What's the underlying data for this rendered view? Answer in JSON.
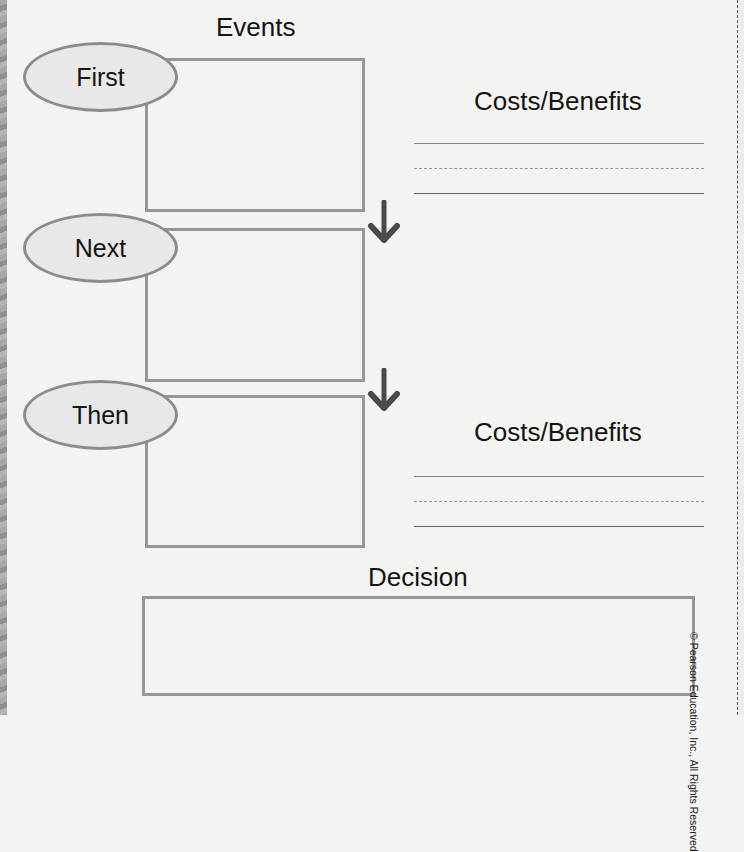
{
  "worksheet": {
    "events_heading": "Events",
    "steps": [
      {
        "label": "First"
      },
      {
        "label": "Next"
      },
      {
        "label": "Then"
      }
    ],
    "costs_benefits": [
      {
        "heading": "Costs/Benefits"
      },
      {
        "heading": "Costs/Benefits"
      }
    ],
    "decision_heading": "Decision",
    "copyright": "© Pearson Education, Inc., All Rights Reserved"
  },
  "colors": {
    "background": "#f3f3f1",
    "box_border": "#979797",
    "oval_border": "#8c8c8c",
    "oval_fill": "#e8e8e8",
    "arrow": "#4a4a4a",
    "text": "#141414"
  },
  "icons": [
    "down-arrow-icon",
    "down-arrow-icon"
  ]
}
